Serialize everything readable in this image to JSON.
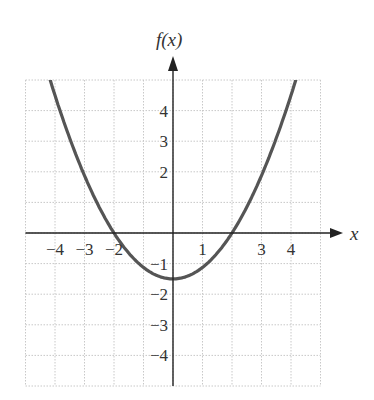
{
  "chart_data": {
    "type": "line",
    "title": "",
    "xlabel": "x",
    "ylabel": "f(x)",
    "xlim": [
      -5,
      5
    ],
    "ylim": [
      -5,
      5
    ],
    "grid": true,
    "legend": null,
    "x_tick_labels": [
      {
        "value": -4,
        "label": "−4"
      },
      {
        "value": -3,
        "label": "−3"
      },
      {
        "value": -2,
        "label": "−2"
      },
      {
        "value": 1,
        "label": "1"
      },
      {
        "value": 3,
        "label": "3"
      },
      {
        "value": 4,
        "label": "4"
      }
    ],
    "y_tick_labels": [
      {
        "value": 4,
        "label": "4"
      },
      {
        "value": 3,
        "label": "3"
      },
      {
        "value": 2,
        "label": "2"
      },
      {
        "value": -1,
        "label": "−1"
      },
      {
        "value": -2,
        "label": "−2"
      },
      {
        "value": -3,
        "label": "−3"
      },
      {
        "value": -4,
        "label": "−4"
      }
    ],
    "series": [
      {
        "name": "f(x)",
        "description": "upward-opening parabola, vertex ≈ (0, −1.5), roots ≈ ±2",
        "x": [
          -4.2,
          -4,
          -3,
          -2,
          -1,
          0,
          1,
          2,
          3,
          4,
          4.2
        ],
        "y": [
          5.1,
          4.5,
          1.875,
          0,
          -1.125,
          -1.5,
          -1.125,
          0,
          1.875,
          4.5,
          5.1
        ]
      }
    ]
  },
  "colors": {
    "curve": "#555555",
    "axis": "#222222",
    "grid": "#c8c8c8",
    "text": "#333333"
  }
}
